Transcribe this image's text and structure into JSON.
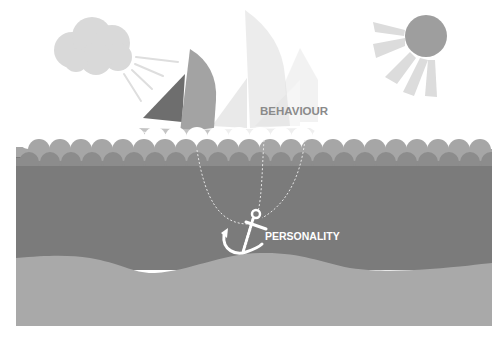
{
  "scene": {
    "title": "Behaviour vs Personality metaphor",
    "labels": {
      "behaviour": "BEHAVIOUR",
      "personality": "PERSONALITY"
    },
    "elements": [
      "cloud",
      "sun",
      "sailboat",
      "waves",
      "sea",
      "anchor",
      "anchor-chain",
      "seabed"
    ],
    "colors": {
      "sky": "#ffffff",
      "cloud": "#d9d9d9",
      "sun": "#9e9e9e",
      "sun_rays": "#dcdcdc",
      "sail_dark": "#6e6e6e",
      "sail_mid": "#a3a3a3",
      "wave_light": "#a6a6a6",
      "wave_dark": "#8c8c8c",
      "sea": "#7b7b7b",
      "seabed": "#a9a9a9",
      "label_behaviour": "#8a8a8a",
      "label_personality": "#ffffff"
    }
  }
}
